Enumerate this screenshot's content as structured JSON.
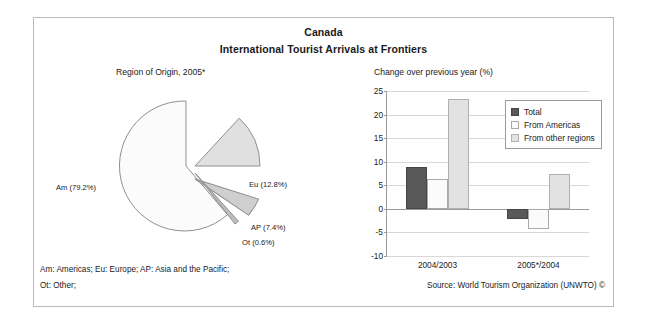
{
  "header": {
    "title_line1": "Canada",
    "title_line2": "International Tourist Arrivals at Frontiers"
  },
  "pie_subtitle": "Region of Origin, 2005*",
  "bar_subtitle": "Change over previous year (%)",
  "footnotes": {
    "line1": "Am: Americas; Eu: Europe; AP: Asia and the Pacific;",
    "line2": "Ot: Other;",
    "source": "Source: World Tourism Organization (UNWTO) ©"
  },
  "colors": {
    "total": "#595959",
    "americas": "#fbfbfb",
    "other_regions": "#e2e2e2",
    "frame": "#b9b9b9",
    "gridline": "#d8d8d8",
    "axis": "#9a9a9a"
  },
  "pie_labels": {
    "am": "Am (79.2%)",
    "eu": "Eu (12.8%)",
    "ap": "AP (7.4%)",
    "ot": "Ot (0.6%)"
  },
  "legend": {
    "items": [
      {
        "label": "Total",
        "key": "total"
      },
      {
        "label": "From Americas",
        "key": "americas"
      },
      {
        "label": "From other regions",
        "key": "other_regions"
      }
    ]
  },
  "chart_data": [
    {
      "type": "pie",
      "title": "Region of Origin, 2005*",
      "labels": [
        "Am",
        "Eu",
        "AP",
        "Ot"
      ],
      "label_texts": [
        "Am (79.2%)",
        "Eu (12.8%)",
        "AP (7.4%)",
        "Ot (0.6%)"
      ],
      "values": [
        79.2,
        12.8,
        7.4,
        0.6
      ],
      "unit": "%",
      "exploded": [
        "Eu",
        "AP",
        "Ot"
      ],
      "slice_colors": [
        "#fbfbfb",
        "#e0e0e0",
        "#cfcfcf",
        "#bdbdbd"
      ],
      "legend": "Am: Americas; Eu: Europe; AP: Asia and the Pacific; Ot: Other;"
    },
    {
      "type": "bar",
      "title": "Change over previous year (%)",
      "categories": [
        "2004/2003",
        "2005*/2004"
      ],
      "series": [
        {
          "name": "Total",
          "values": [
            8.8,
            -2.2
          ]
        },
        {
          "name": "From Americas",
          "values": [
            6.4,
            -4.3
          ]
        },
        {
          "name": "From other regions",
          "values": [
            23.2,
            7.5
          ]
        }
      ],
      "ylabel": "",
      "xlabel": "",
      "ylim": [
        -10,
        25
      ],
      "yticks": [
        25,
        20,
        15,
        10,
        5,
        0,
        -5,
        -10
      ],
      "grid": true,
      "legend_position": "top-right"
    }
  ]
}
